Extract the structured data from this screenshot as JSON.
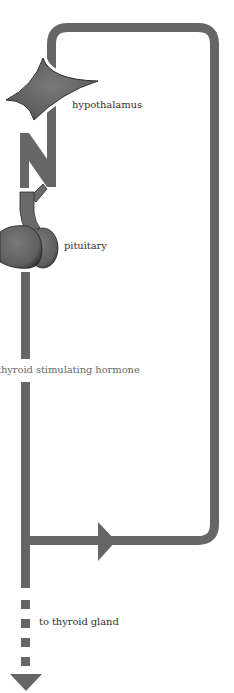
{
  "diagram": {
    "colors": {
      "stroke": "#666666",
      "organ_fill": "#6e6e6e",
      "organ_outline": "#2a2a2a",
      "label_text": "#333333",
      "hormone_text": "#6a6a6a",
      "background": "#ffffff"
    },
    "labels": {
      "hypothalamus": "hypothalamus",
      "pituitary": "pituitary",
      "hormone": "thyroid stimulating hormone",
      "target": "to thyroid gland"
    },
    "icons": {
      "hypothalamus": "hypothalamus-shape-icon",
      "pituitary": "pituitary-gland-icon",
      "nerve_signal": "zigzag-signal-icon",
      "feedback_arrow": "arrow-right-icon",
      "output_arrow": "arrow-down-icon"
    }
  }
}
